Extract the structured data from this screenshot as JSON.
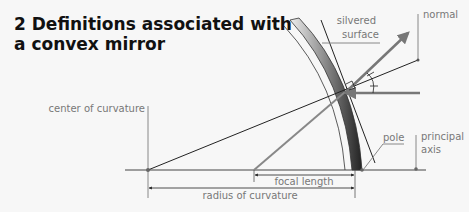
{
  "title": "2 Definitions associated with a convex mirror",
  "labels": {
    "silvered_surface_1": "silvered",
    "silvered_surface_2": "surface",
    "normal": "normal",
    "center_of_curvature": "center of curvature",
    "pole": "pole",
    "principal_axis_1": "principal",
    "principal_axis_2": "axis",
    "focal_length": "focal length",
    "radius_of_curvature": "radius of curvature"
  },
  "colors": {
    "ray": "#777777",
    "line": "#222222",
    "label": "#777777"
  }
}
